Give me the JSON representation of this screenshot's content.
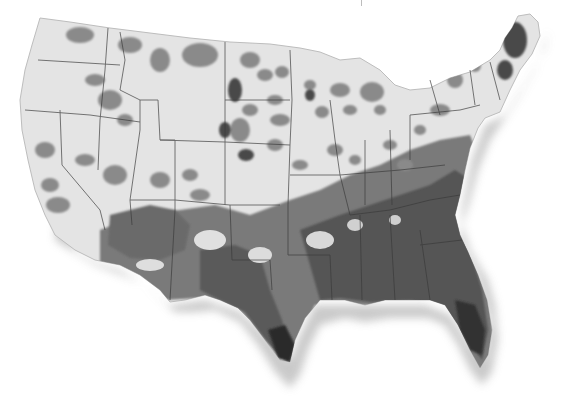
{
  "image": {
    "subject": "Photograph of a physical relief-style map of the contiguous United States with gray shaded county patches",
    "caption_fragment": "",
    "colors": {
      "background": "#ffffff",
      "map_base": "#e6e6e6",
      "map_light_patch": "#d2d2d2",
      "map_mid_patch": "#8a8a8a",
      "map_dark_patch": "#4a4a4a",
      "map_darkest": "#2a2a2a",
      "state_border": "#3a3a3a",
      "shadow": "#c8c8c8"
    }
  }
}
